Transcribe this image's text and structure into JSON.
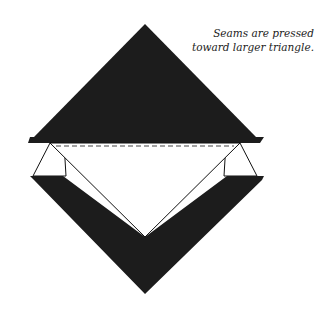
{
  "caption": {
    "line1": "Seams are pressed",
    "line2": "toward larger triangle."
  },
  "diagram": {
    "colors": {
      "fill_dark": "#1c1c1c",
      "fill_light": "#ffffff",
      "stroke": "#111111",
      "seam_dash": "#444444"
    }
  }
}
